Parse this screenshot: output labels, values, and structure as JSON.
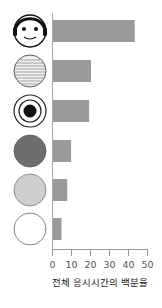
{
  "chart_data": {
    "type": "bar",
    "orientation": "horizontal",
    "title": "",
    "xlabel": "전체 응시시간의 백분율",
    "ylabel": "",
    "xlim": [
      0,
      50
    ],
    "xticks": [
      0,
      10,
      20,
      30,
      40,
      50
    ],
    "grid": false,
    "legend": null,
    "categories": [
      "face-icon",
      "text-texture-icon",
      "target-rings-icon",
      "dark-gray-circle",
      "light-gray-circle",
      "white-circle"
    ],
    "values": [
      43,
      20,
      19,
      9.5,
      7.5,
      4.5
    ],
    "bar_color": "#9a9a9a"
  },
  "axis": {
    "tick_labels": [
      "0",
      "10",
      "20",
      "30",
      "40",
      "50"
    ],
    "title": "전체 응시시간의 백분율"
  },
  "colors": {
    "bar": "#9a9a9a",
    "axis": "#999999",
    "dark_circle": "#6e6e6e",
    "light_circle": "#cfcfcf"
  }
}
